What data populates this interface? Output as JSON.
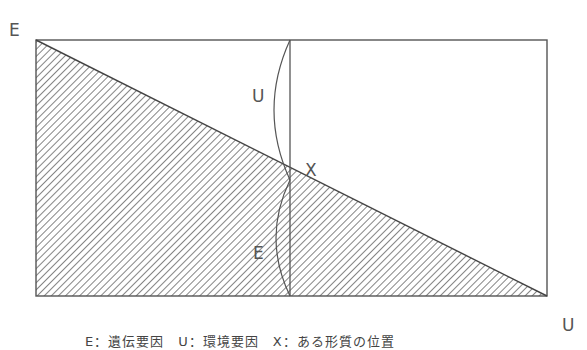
{
  "diagram": {
    "labels": {
      "top_left": "E",
      "upper_arc": "U",
      "intersection": "X",
      "lower_arc": "E",
      "bottom_right": "U"
    },
    "caption": "E：遺伝要因　U：環境要因　X：ある形質の位置",
    "colors": {
      "line": "#555555",
      "hatch": "#666666",
      "text": "#555555"
    }
  }
}
